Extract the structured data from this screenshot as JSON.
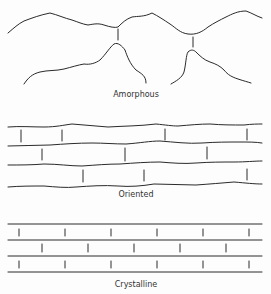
{
  "diagram": {
    "panels": [
      {
        "id": "amorphous",
        "label": "Amorphous"
      },
      {
        "id": "oriented",
        "label": "Oriented"
      },
      {
        "id": "crystalline",
        "label": "Crystalline"
      }
    ]
  }
}
